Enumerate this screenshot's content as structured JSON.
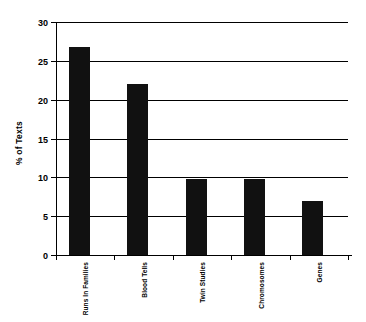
{
  "chart_data": {
    "type": "bar",
    "title": "",
    "subtitle": "",
    "xlabel": "",
    "ylabel": "% of Texts",
    "categories": [
      "Runs In Families",
      "Blood Tells",
      "Twin Studies",
      "Chromosomes",
      "Genes"
    ],
    "values": [
      26.8,
      22.0,
      9.8,
      9.8,
      7.0
    ],
    "ylim": [
      0,
      30
    ],
    "ytick_labels": [
      "0",
      "5",
      "10",
      "15",
      "20",
      "25",
      "30"
    ],
    "ytick_values": [
      0,
      5,
      10,
      15,
      20,
      25,
      30
    ],
    "grid": true,
    "grid_axis": "y",
    "legend": false,
    "legend_position": "none",
    "bar_color": "#111111",
    "axis_color": "#000000",
    "background_color": "#ffffff",
    "orientation": "vertical"
  }
}
